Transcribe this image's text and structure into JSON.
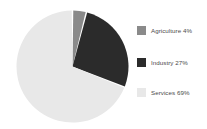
{
  "background_color": "#ffffff",
  "chart_data": {
    "type": "pie",
    "title": "",
    "subtitle": "",
    "xlabel": "",
    "ylabel": "",
    "grid": false,
    "legend_position": "right",
    "start_angle_deg": 0,
    "direction": "clockwise",
    "units": "percent",
    "categories": [
      "Agriculture",
      "Industry",
      "Services"
    ],
    "values": [
      4,
      27,
      69
    ],
    "colors": [
      "#8a8a8a",
      "#2b2b2b",
      "#e8e8e8"
    ],
    "slices": [
      {
        "label": "Agriculture",
        "value": 4,
        "display": "4%",
        "color": "#8a8a8a"
      },
      {
        "label": "Industry",
        "value": 27,
        "display": "27%",
        "color": "#2b2b2b"
      },
      {
        "label": "Services",
        "value": 69,
        "display": "69%",
        "color": "#e8e8e8"
      }
    ],
    "annotations": []
  },
  "legend": {
    "items": [
      {
        "text": "Agriculture 4%",
        "color": "#8a8a8a"
      },
      {
        "text": "Industry 27%",
        "color": "#2b2b2b"
      },
      {
        "text": "Services 69%",
        "color": "#e8e8e8"
      }
    ]
  }
}
